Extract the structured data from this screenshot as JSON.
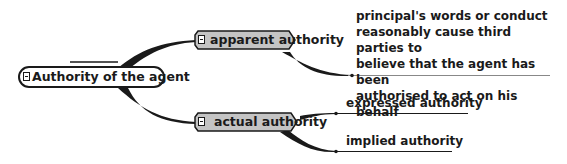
{
  "diagram": {
    "type": "mind-map",
    "colors": {
      "line": "#1a1a1a",
      "main_topic_fill": "#c4c4c4",
      "central_fill": "#ffffff",
      "background": "#ffffff"
    },
    "central": {
      "label": "Authority of the agent",
      "collapse_icon": "minus-box"
    },
    "branches": [
      {
        "label": "apparent authority",
        "collapse_icon": "minus-box",
        "children": [
          {
            "lines": [
              "principal's words or conduct",
              "reasonably cause third parties to",
              "believe that the agent has been",
              "authorised to act on his behalf"
            ]
          }
        ]
      },
      {
        "label": "actual authority",
        "collapse_icon": "minus-box",
        "children": [
          {
            "label": "expressed authority"
          },
          {
            "label": "implied authority"
          }
        ]
      }
    ]
  }
}
